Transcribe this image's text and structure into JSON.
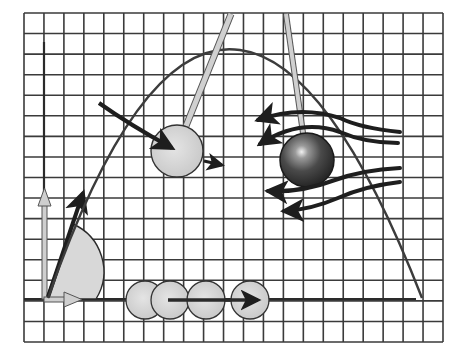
{
  "figure": {
    "colors": {
      "background": "#ffffff",
      "grid": "#3a3a3a",
      "trajectory": "#3c3c3c",
      "arrow_dark": "#1e1e1e",
      "ball_light": "#d6d6d6",
      "ball_dark": "#3a3a3a",
      "rod": "#cfcfcf",
      "angle_fill": "#d8d8d8"
    },
    "grid": {
      "x0": 24,
      "y0": 13,
      "x1": 443,
      "y1": 342,
      "cell": 20.2
    },
    "elements": [
      {
        "name": "parabolic-trajectory",
        "description": "projectile path from launch point to landing"
      },
      {
        "name": "launch-velocity-vectors",
        "description": "velocity vector with vertical and horizontal components"
      },
      {
        "name": "launch-angle-wedge",
        "description": "shaded angle sector at origin"
      },
      {
        "name": "pendulum-ball",
        "description": "light ball on rod with incoming and outgoing arrows"
      },
      {
        "name": "spinning-ball-airflow",
        "description": "dark ball with airflow streamlines (Magnus effect)"
      },
      {
        "name": "rolling-ball-sequence",
        "description": "four light balls along ground with motion arrow"
      }
    ]
  }
}
